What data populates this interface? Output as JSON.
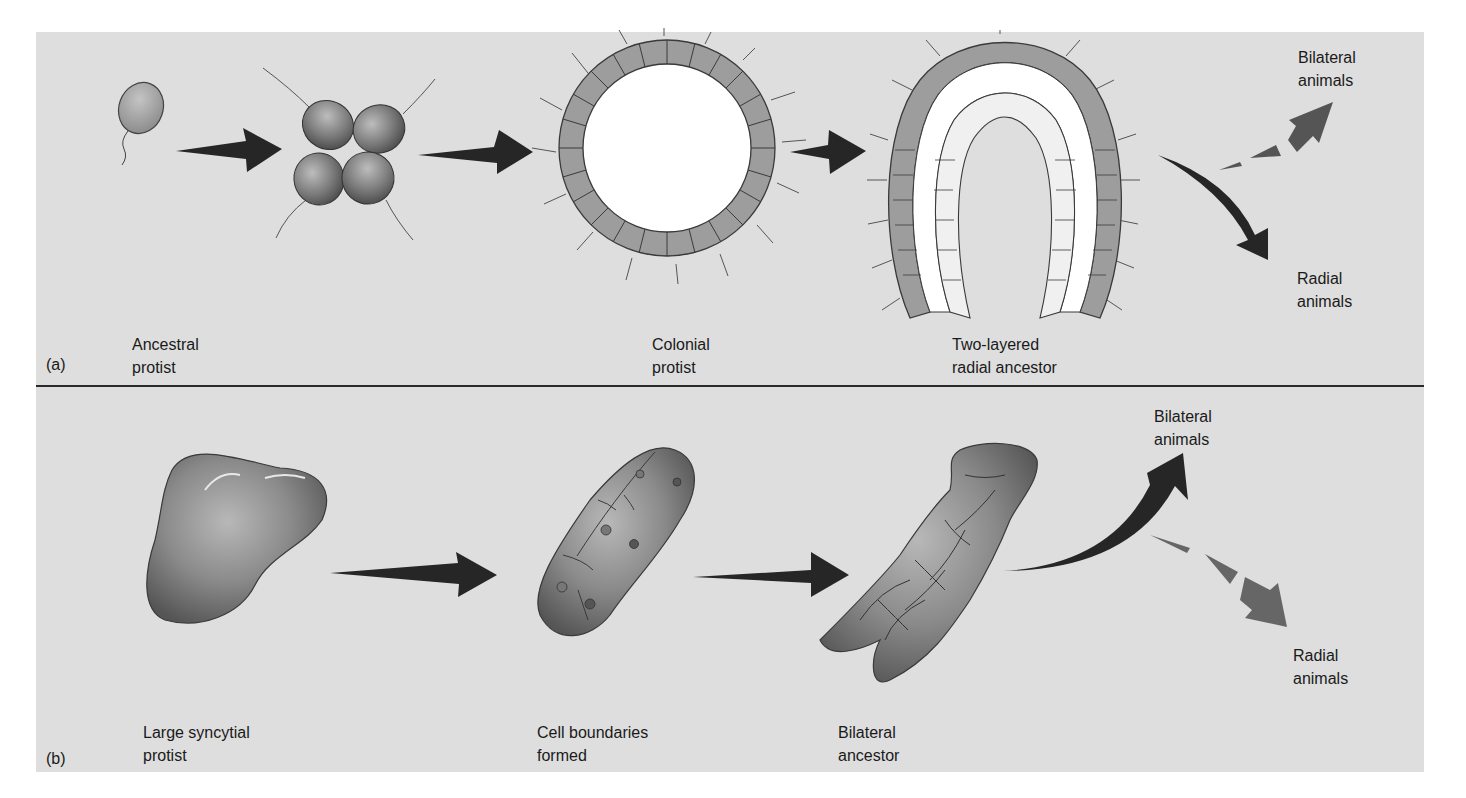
{
  "figure": {
    "panels": [
      {
        "id": "a",
        "part_label": "(a)",
        "stages": [
          {
            "name": "ancestral-protist",
            "label": "Ancestral\nprotist"
          },
          {
            "name": "colonial-protist",
            "label": "Colonial\nprotist"
          },
          {
            "name": "two-layered-radial-ancestor",
            "label": "Two-layered\nradial ancestor"
          }
        ],
        "outcomes": [
          {
            "name": "bilateral-animals",
            "label": "Bilateral\nanimals",
            "arrow": "dashed"
          },
          {
            "name": "radial-animals",
            "label": "Radial\nanimals",
            "arrow": "solid"
          }
        ]
      },
      {
        "id": "b",
        "part_label": "(b)",
        "stages": [
          {
            "name": "large-syncytial-protist",
            "label": "Large syncytial\nprotist"
          },
          {
            "name": "cell-boundaries-formed",
            "label": "Cell boundaries\nformed"
          },
          {
            "name": "bilateral-ancestor",
            "label": "Bilateral\nancestor"
          }
        ],
        "outcomes": [
          {
            "name": "bilateral-animals",
            "label": "Bilateral\nanimals",
            "arrow": "solid"
          },
          {
            "name": "radial-animals",
            "label": "Radial\nanimals",
            "arrow": "dashed"
          }
        ]
      }
    ],
    "colors": {
      "background": "#dedede",
      "arrow_solid": "#262626",
      "arrow_dashed": "#5a5a5a",
      "cell_fill": "#9a9a9a",
      "divider": "#2a2a2a"
    }
  }
}
